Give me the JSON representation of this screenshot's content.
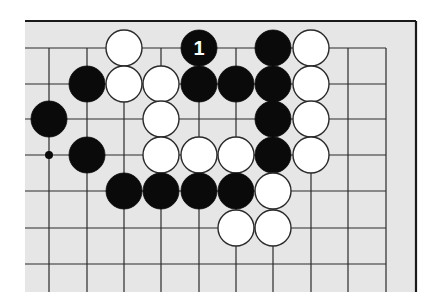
{
  "diagram": {
    "type": "go-board-partial",
    "background": "#e6e6e6",
    "line_color": "#2a2a2a",
    "black_color": "#0a0a0a",
    "white_color": "#ffffff",
    "board_area": {
      "x": 25,
      "y": 21,
      "right": 416,
      "bottom": 292
    },
    "grid": {
      "x": [
        49,
        87,
        124,
        161,
        199,
        236,
        273,
        311,
        348,
        386
      ],
      "y": [
        48,
        84,
        119,
        155,
        191,
        228,
        264
      ],
      "line_left": 25,
      "line_right": 386,
      "line_bottom": 292,
      "top_edge_y": 21,
      "right_edge_x": 416
    },
    "stone_radius": 18,
    "stones": [
      {
        "color": "white",
        "col": 2,
        "row": 0
      },
      {
        "color": "black",
        "col": 4,
        "row": 0,
        "label": "1"
      },
      {
        "color": "black",
        "col": 6,
        "row": 0
      },
      {
        "color": "white",
        "col": 7,
        "row": 0
      },
      {
        "color": "black",
        "col": 1,
        "row": 1
      },
      {
        "color": "white",
        "col": 2,
        "row": 1
      },
      {
        "color": "white",
        "col": 3,
        "row": 1
      },
      {
        "color": "black",
        "col": 4,
        "row": 1
      },
      {
        "color": "black",
        "col": 5,
        "row": 1
      },
      {
        "color": "black",
        "col": 6,
        "row": 1
      },
      {
        "color": "white",
        "col": 7,
        "row": 1
      },
      {
        "color": "black",
        "col": 0,
        "row": 2
      },
      {
        "color": "white",
        "col": 3,
        "row": 2
      },
      {
        "color": "black",
        "col": 6,
        "row": 2
      },
      {
        "color": "white",
        "col": 7,
        "row": 2
      },
      {
        "color": "black",
        "col": 1,
        "row": 3
      },
      {
        "color": "white",
        "col": 3,
        "row": 3
      },
      {
        "color": "white",
        "col": 4,
        "row": 3
      },
      {
        "color": "white",
        "col": 5,
        "row": 3
      },
      {
        "color": "black",
        "col": 6,
        "row": 3
      },
      {
        "color": "white",
        "col": 7,
        "row": 3
      },
      {
        "color": "black",
        "col": 2,
        "row": 4
      },
      {
        "color": "black",
        "col": 3,
        "row": 4
      },
      {
        "color": "black",
        "col": 4,
        "row": 4
      },
      {
        "color": "black",
        "col": 5,
        "row": 4
      },
      {
        "color": "white",
        "col": 6,
        "row": 4
      },
      {
        "color": "white",
        "col": 5,
        "row": 5
      },
      {
        "color": "white",
        "col": 6,
        "row": 5
      }
    ],
    "markers": [
      {
        "type": "dot",
        "col": 0,
        "row": 3,
        "radius": 4
      }
    ],
    "move_labels": [
      "1"
    ]
  }
}
